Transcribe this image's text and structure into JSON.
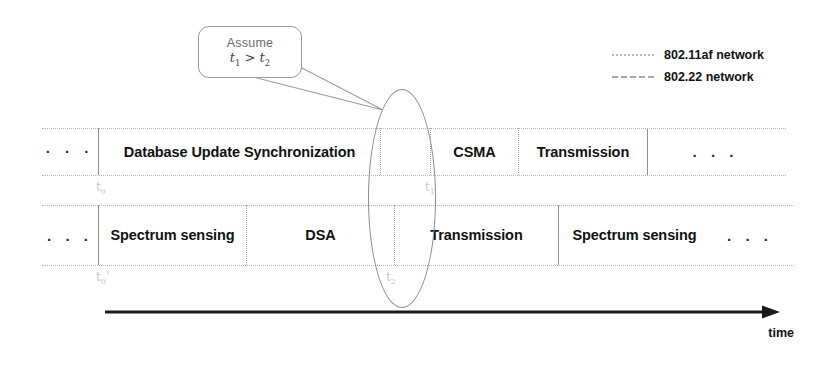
{
  "callout": {
    "line1": "Assume",
    "relation_left": "t",
    "relation_left_sub": "1",
    "operator": " > ",
    "relation_right": "t",
    "relation_right_sub": "2",
    "full_text": "Assume t1 > t2"
  },
  "legend": {
    "items": [
      {
        "label": "802.11af network",
        "style": "dotted",
        "color": "#b9b9b9"
      },
      {
        "label": "802.22 network",
        "style": "dashed",
        "color": "#a9a9a9"
      }
    ]
  },
  "timeline": {
    "axis_label": "time",
    "rows": [
      {
        "network": "802.11af network",
        "cells": [
          {
            "text": "· · ·",
            "kind": "dots",
            "width": 56,
            "divider": "none"
          },
          {
            "text": "Database Update Synchronization",
            "kind": "slot",
            "width": 282,
            "divider": "solid"
          },
          {
            "text": "",
            "kind": "gap",
            "width": 50,
            "divider": "dotted"
          },
          {
            "text": "CSMA",
            "kind": "slot",
            "width": 88,
            "divider": "dotted"
          },
          {
            "text": "Transmission",
            "kind": "slot",
            "width": 129,
            "divider": "dotted"
          },
          {
            "text": ". . .",
            "kind": "dots",
            "width": 136,
            "divider": "solid"
          }
        ]
      },
      {
        "network": "802.22 network",
        "cells": [
          {
            "text": ". . .",
            "kind": "dots",
            "width": 56,
            "divider": "none"
          },
          {
            "text": "Spectrum sensing",
            "kind": "slot",
            "width": 148,
            "divider": "solid"
          },
          {
            "text": "DSA",
            "kind": "slot",
            "width": 148,
            "divider": "dotted"
          },
          {
            "text": "Transmission",
            "kind": "slot",
            "width": 164,
            "divider": "dotted"
          },
          {
            "text": "Spectrum sensing",
            "kind": "slot",
            "width": 152,
            "divider": "solid"
          },
          {
            "text": ". . .",
            "kind": "dots",
            "width": 80,
            "divider": "none"
          }
        ]
      }
    ],
    "ticks": [
      {
        "name": "t0",
        "base": "t",
        "sub": "0",
        "prime": "",
        "x": 96,
        "y": 180
      },
      {
        "name": "t1",
        "base": "t",
        "sub": "1",
        "prime": "",
        "x": 425,
        "y": 180
      },
      {
        "name": "t0prime",
        "base": "t",
        "sub": "0",
        "prime": "'",
        "x": 96,
        "y": 270
      },
      {
        "name": "t2",
        "base": "t",
        "sub": "2",
        "prime": "",
        "x": 386,
        "y": 270
      }
    ]
  },
  "colors": {
    "rail": "#b4b4b4",
    "divider_solid": "#8f8f8f",
    "divider_dotted": "#a8a8a8",
    "ellipse": "#8b8b8b",
    "callout_border": "#9a9a9a",
    "tick_text": "#c9c9c9",
    "axis": "#1a1a1a",
    "text": "#111111"
  }
}
